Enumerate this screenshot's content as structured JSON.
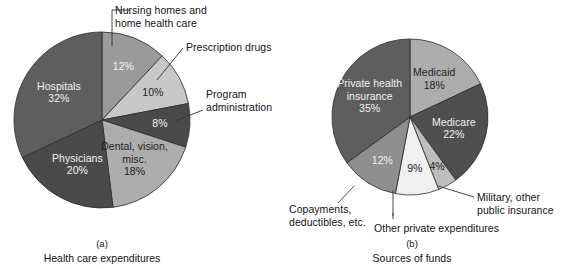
{
  "figure": {
    "background": "#ffffff",
    "charts": [
      {
        "id": "health-care-expenditures",
        "panel_letter": "(a)",
        "caption": "Health care expenditures",
        "center": {
          "x": 102,
          "y": 120
        },
        "radius": 88,
        "slices": [
          {
            "name": "Nursing homes and home health care",
            "value": 12,
            "label": "12%",
            "color": "#9a9a9a",
            "text_color": "on-dark",
            "inside_label_only_pct": true,
            "callout": true
          },
          {
            "name": "Prescription drugs",
            "value": 10,
            "label": "10%",
            "color": "#c8c8c8",
            "text_color": "on-light",
            "inside_label_only_pct": true,
            "callout": true
          },
          {
            "name": "Program administration",
            "value": 8,
            "label": "8%",
            "color": "#4a4a4a",
            "text_color": "on-dark",
            "inside_label_only_pct": true,
            "callout": true
          },
          {
            "name": "Dental, vision, misc.",
            "value": 18,
            "label": "Dental, vision,\nmisc.\n18%",
            "color": "#adadad",
            "text_color": "on-light",
            "inside_label_only_pct": false,
            "callout": false
          },
          {
            "name": "Physicians",
            "value": 20,
            "label": "Physicians\n20%",
            "color": "#4a4a4a",
            "text_color": "on-dark",
            "inside_label_only_pct": false,
            "callout": false
          },
          {
            "name": "Hospitals",
            "value": 32,
            "label": "Hospitals\n32%",
            "color": "#5e5e5e",
            "text_color": "on-dark",
            "inside_label_only_pct": false,
            "callout": false
          }
        ],
        "callouts": [
          {
            "name": "nursing-homes",
            "text": "Nursing homes and\nhome health care",
            "x": 115,
            "y": 4
          },
          {
            "name": "prescription-drugs",
            "text": "Prescription drugs",
            "x": 186,
            "y": 41
          },
          {
            "name": "program-administration",
            "text": "Program\nadministration",
            "x": 206,
            "y": 88
          }
        ]
      },
      {
        "id": "sources-of-funds",
        "panel_letter": "(b)",
        "caption": "Sources of funds",
        "center": {
          "x": 410,
          "y": 117
        },
        "radius": 78,
        "slices": [
          {
            "name": "Medicaid",
            "value": 18,
            "label": "Medicaid\n18%",
            "color": "#adadad",
            "text_color": "on-light",
            "inside_label_only_pct": false,
            "callout": false
          },
          {
            "name": "Medicare",
            "value": 22,
            "label": "Medicare\n22%",
            "color": "#4f4f4f",
            "text_color": "on-dark",
            "inside_label_only_pct": false,
            "callout": false
          },
          {
            "name": "Military, other public insurance",
            "value": 4,
            "label": "4%",
            "color": "#bdbdbd",
            "text_color": "on-light",
            "inside_label_only_pct": true,
            "callout": true
          },
          {
            "name": "Other private expenditures",
            "value": 9,
            "label": "9%",
            "color": "#f0f0f0",
            "text_color": "on-light",
            "inside_label_only_pct": true,
            "callout": true
          },
          {
            "name": "Copayments, deductibles, etc.",
            "value": 12,
            "label": "12%",
            "color": "#8f8f8f",
            "text_color": "on-dark",
            "inside_label_only_pct": true,
            "callout": true
          },
          {
            "name": "Private health insurance",
            "value": 35,
            "label": "Private health\ninsurance\n35%",
            "color": "#5e5e5e",
            "text_color": "on-dark",
            "inside_label_only_pct": false,
            "callout": false
          }
        ],
        "callouts": [
          {
            "name": "copayments-deductibles",
            "text": "Copayments,\ndeductibles, etc.",
            "x": 289,
            "y": 203
          },
          {
            "name": "other-private-expenditures",
            "text": "Other private expenditures",
            "x": 374,
            "y": 222
          },
          {
            "name": "military-other-public-insurance",
            "text": "Military, other\npublic insurance",
            "x": 477,
            "y": 191
          }
        ]
      }
    ]
  }
}
